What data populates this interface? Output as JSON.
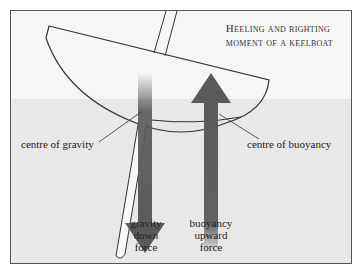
{
  "title": {
    "line1": "Heeling and righting",
    "line2": "moment of a keelboat"
  },
  "labels": {
    "centre_of_gravity": "centre of gravity",
    "centre_of_buoyancy": "centre of buoyancy"
  },
  "forces": {
    "gravity": [
      "gravity",
      "down",
      "force"
    ],
    "buoyancy": [
      "buoyancy",
      "upward",
      "force"
    ]
  },
  "colors": {
    "arrow": "#5a5a5a",
    "line": "#333333",
    "border": "#555555",
    "background": "#f6f6f6",
    "water": "#e8e8e8"
  }
}
